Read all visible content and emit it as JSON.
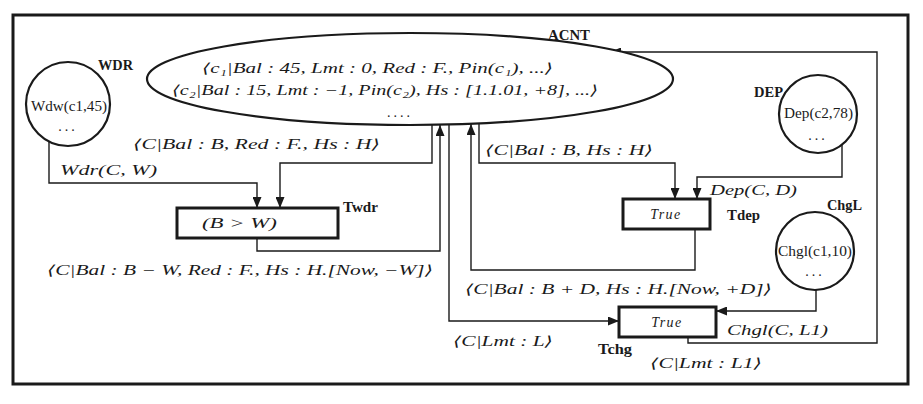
{
  "colors": {
    "stroke": "#1a1a1a",
    "background": "#ffffff"
  },
  "places": {
    "acnt": {
      "label": "ACNT",
      "tokens": [
        "⟨c₁|Bal : 45, Lmt : 0, Red : F., Pin(c₁), ...⟩",
        "⟨c₂|Bal : 15, Lmt : −1, Pin(c₂), Hs : [1.1.01, +8], ...⟩",
        "...."
      ]
    },
    "wdr": {
      "label": "WDR",
      "tokens": [
        "Wdw(c1,45)",
        "..."
      ]
    },
    "dep": {
      "label": "DEP",
      "tokens": [
        "Dep(c2,78)",
        "..."
      ]
    },
    "chgl": {
      "label": "ChgL",
      "tokens": [
        "Chgl(c1,10)",
        "..."
      ]
    }
  },
  "transitions": {
    "twdr": {
      "label": "Twdr",
      "guard": "(B > W)"
    },
    "tdep": {
      "label": "Tdep",
      "guard": "True"
    },
    "tchg": {
      "label": "Tchg",
      "guard": "True"
    }
  },
  "arcs": [
    {
      "from": "WDR",
      "to": "Twdr",
      "inscription": "Wdr(C, W)"
    },
    {
      "from": "ACNT",
      "to": "Twdr",
      "inscription": "⟨C|Bal : B, Red : F., Hs : H⟩"
    },
    {
      "from": "Twdr",
      "to": "ACNT",
      "inscription": "⟨C|Bal : B − W, Red : F., Hs : H.[Now, −W]⟩"
    },
    {
      "from": "ACNT",
      "to": "Tdep",
      "inscription": "⟨C|Bal : B, Hs : H⟩"
    },
    {
      "from": "DEP",
      "to": "Tdep",
      "inscription": "Dep(C, D)"
    },
    {
      "from": "Tdep",
      "to": "ACNT",
      "inscription": "⟨C|Bal : B + D, Hs : H.[Now, +D]⟩"
    },
    {
      "from": "ACNT",
      "to": "Tchg",
      "inscription": "⟨C|Lmt : L⟩"
    },
    {
      "from": "ChgL",
      "to": "Tchg",
      "inscription": "Chgl(C, L1)"
    },
    {
      "from": "Tchg",
      "to": "ACNT",
      "inscription": "⟨C|Lmt : L1⟩"
    }
  ]
}
